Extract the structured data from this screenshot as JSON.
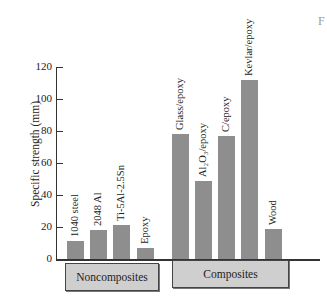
{
  "chart_data": {
    "type": "bar",
    "title": "",
    "xlabel": "",
    "ylabel": "Specific strength (mm)",
    "ylim": [
      0,
      120
    ],
    "yticks": [
      0,
      20,
      40,
      60,
      80,
      100,
      120
    ],
    "grid": false,
    "categories": [
      "1040 steel",
      "2048 Al",
      "Ti-5Al-2.5Sn",
      "Epoxy",
      "Glass/epoxy",
      "Al2O3/epoxy",
      "C/epoxy",
      "Kevlar/epoxy",
      "Wood"
    ],
    "values": [
      11,
      18,
      21,
      7,
      78,
      49,
      77,
      112,
      19
    ],
    "groups": [
      {
        "name": "Noncomposites",
        "members": [
          "1040 steel",
          "2048 Al",
          "Ti-5Al-2.5Sn",
          "Epoxy"
        ]
      },
      {
        "name": "Composites",
        "members": [
          "Glass/epoxy",
          "Al2O3/epoxy",
          "C/epoxy",
          "Kevlar/epoxy",
          "Wood"
        ]
      }
    ],
    "bar_color": "#8e8e8e"
  },
  "labels": {
    "ylabel": "Specific strength (mm)",
    "ticks": [
      "0",
      "20",
      "40",
      "60",
      "80",
      "100",
      "120"
    ],
    "bars": [
      "1040 steel",
      "2048 Al",
      "Ti-5Al-2.5Sn",
      "Epoxy",
      "Glass/epoxy",
      "Al₂O₃/epoxy",
      "C/epoxy",
      "Kevlar/epoxy",
      "Wood"
    ],
    "group_noncomposites": "Noncomposites",
    "group_composites": "Composites",
    "corner_mark": "F"
  }
}
